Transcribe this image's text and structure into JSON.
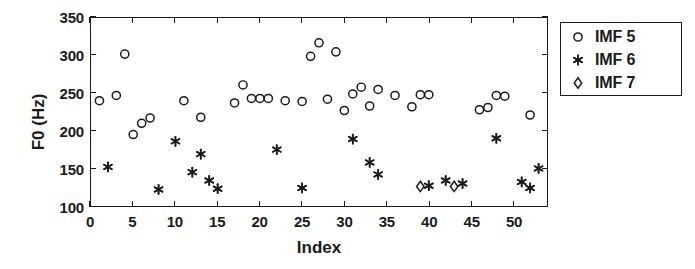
{
  "chart_data": {
    "type": "scatter",
    "title": "",
    "xlabel": "Index",
    "ylabel": "F0 (Hz)",
    "xlim": [
      0,
      54
    ],
    "ylim": [
      100,
      350
    ],
    "xticks": [
      0,
      5,
      10,
      15,
      20,
      25,
      30,
      35,
      40,
      45,
      50
    ],
    "yticks": [
      100,
      150,
      200,
      250,
      300,
      350
    ],
    "xticklabels": [
      "0",
      "5",
      "10",
      "15",
      "20",
      "25",
      "30",
      "35",
      "40",
      "45",
      "50"
    ],
    "yticklabels": [
      "100",
      "150",
      "200",
      "250",
      "300",
      "350"
    ],
    "grid": false,
    "legend_position": "top-right",
    "series": [
      {
        "name": "IMF 5",
        "marker": "circle",
        "color": "#1a1a1a",
        "points": [
          [
            1,
            240
          ],
          [
            3,
            247
          ],
          [
            4,
            302
          ],
          [
            5,
            195
          ],
          [
            6,
            210
          ],
          [
            7,
            217
          ],
          [
            11,
            240
          ],
          [
            13,
            218
          ],
          [
            17,
            237
          ],
          [
            18,
            261
          ],
          [
            19,
            243
          ],
          [
            20,
            243
          ],
          [
            21,
            243
          ],
          [
            23,
            240
          ],
          [
            25,
            239
          ],
          [
            26,
            299
          ],
          [
            27,
            317
          ],
          [
            28,
            242
          ],
          [
            29,
            305
          ],
          [
            30,
            227
          ],
          [
            31,
            249
          ],
          [
            32,
            258
          ],
          [
            33,
            233
          ],
          [
            34,
            255
          ],
          [
            36,
            247
          ],
          [
            38,
            232
          ],
          [
            39,
            248
          ],
          [
            40,
            248
          ],
          [
            46,
            228
          ],
          [
            47,
            231
          ],
          [
            48,
            247
          ],
          [
            49,
            246
          ],
          [
            52,
            221
          ]
        ]
      },
      {
        "name": "IMF 6",
        "marker": "asterisk",
        "color": "#1a1a1a",
        "points": [
          [
            2,
            152
          ],
          [
            8,
            122
          ],
          [
            10,
            186
          ],
          [
            12,
            145
          ],
          [
            13,
            169
          ],
          [
            14,
            134
          ],
          [
            15,
            123
          ],
          [
            22,
            175
          ],
          [
            25,
            124
          ],
          [
            31,
            189
          ],
          [
            33,
            158
          ],
          [
            34,
            142
          ],
          [
            40,
            127
          ],
          [
            42,
            134
          ],
          [
            44,
            130
          ],
          [
            48,
            190
          ],
          [
            51,
            132
          ],
          [
            52,
            124
          ],
          [
            53,
            150
          ]
        ]
      },
      {
        "name": "IMF 7",
        "marker": "diamond",
        "color": "#1a1a1a",
        "points": [
          [
            39,
            126
          ],
          [
            43,
            126
          ]
        ]
      }
    ]
  },
  "legend": {
    "entries": [
      {
        "label": "IMF 5",
        "marker": "circle"
      },
      {
        "label": "IMF 6",
        "marker": "asterisk"
      },
      {
        "label": "IMF 7",
        "marker": "diamond"
      }
    ]
  }
}
